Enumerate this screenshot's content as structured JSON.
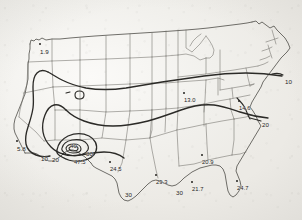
{
  "figure": {
    "type": "contour-map",
    "region": "Continental United States",
    "title": "",
    "background_color": "#f4f3f0",
    "line_color": "#2b2a27",
    "state_border_color": "#6f6e69"
  },
  "chart_data": {
    "type": "contour-map",
    "title": "",
    "xlabel": "",
    "ylabel": "",
    "grid": false,
    "legend": "none",
    "contour_levels": [
      10,
      20,
      30,
      40
    ],
    "station_values": [
      {
        "label": "1.9",
        "x": 40,
        "y": 49,
        "dot": true,
        "region": "Washington"
      },
      {
        "label": "5.8",
        "x": 17,
        "y": 146,
        "dot": true,
        "region": "Southern California"
      },
      {
        "label": "10",
        "x": 41,
        "y": 156,
        "dot": false,
        "region": "Southwest contour"
      },
      {
        "label": "20",
        "x": 52,
        "y": 157,
        "dot": false,
        "region": "Southwest contour"
      },
      {
        "label": "40",
        "x": 70,
        "y": 143,
        "dot": false,
        "region": "Arizona contour"
      },
      {
        "label": "30",
        "x": 86,
        "y": 151,
        "dot": false,
        "region": "Arizona contour"
      },
      {
        "label": "47.5",
        "x": 74,
        "y": 160,
        "dot": false,
        "region": "Arizona peak"
      },
      {
        "label": "24.5",
        "x": 110,
        "y": 167,
        "dot": true,
        "region": "West Texas"
      },
      {
        "label": "30",
        "x": 125,
        "y": 192,
        "dot": false,
        "region": "South Texas contour"
      },
      {
        "label": "29.3",
        "x": 156,
        "y": 180,
        "dot": true,
        "region": "East Texas"
      },
      {
        "label": "30",
        "x": 176,
        "y": 190,
        "dot": false,
        "region": "Gulf Coast contour"
      },
      {
        "label": "21.7",
        "x": 192,
        "y": 187,
        "dot": true,
        "region": "Louisiana"
      },
      {
        "label": "20.9",
        "x": 202,
        "y": 160,
        "dot": true,
        "region": "Alabama"
      },
      {
        "label": "24.7",
        "x": 237,
        "y": 186,
        "dot": true,
        "region": "Florida"
      },
      {
        "label": "13.0",
        "x": 184,
        "y": 98,
        "dot": true,
        "region": "Indiana"
      },
      {
        "label": "14.6",
        "x": 239,
        "y": 106,
        "dot": true,
        "region": "Virginia"
      },
      {
        "label": "10",
        "x": 285,
        "y": 79,
        "dot": false,
        "region": "Northeast contour"
      },
      {
        "label": "20",
        "x": 262,
        "y": 122,
        "dot": false,
        "region": "Carolina contour"
      }
    ]
  }
}
